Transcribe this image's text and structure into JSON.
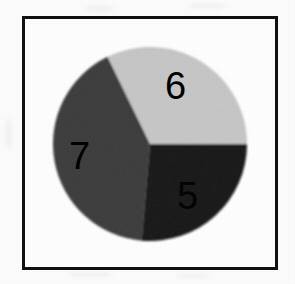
{
  "figure": {
    "frame_color": "#111111",
    "background_color": "#ffffff"
  },
  "chart_data": {
    "type": "pie",
    "title": "",
    "labels": [
      "6",
      "7",
      "5"
    ],
    "values": [
      6,
      7,
      5
    ],
    "total": 18,
    "slices": [
      {
        "label": "6",
        "value": 6,
        "color": "#c8c8c8",
        "start_angle_deg": 0,
        "end_angle_deg": 116,
        "sweep_deg": 116,
        "percent": 32.2,
        "label_position": "upper-right"
      },
      {
        "label": "7",
        "value": 7,
        "color": "#3a3a3a",
        "start_angle_deg": 116,
        "end_angle_deg": 265,
        "sweep_deg": 149,
        "percent": 41.4,
        "label_position": "left"
      },
      {
        "label": "5",
        "value": 5,
        "color": "#141414",
        "start_angle_deg": 265,
        "end_angle_deg": 360,
        "sweep_deg": 95,
        "percent": 26.4,
        "label_position": "lower-right"
      }
    ],
    "legend": null,
    "legend_position": "none",
    "grid": false,
    "xlabel": "",
    "ylabel": "",
    "labels_inside_slices": true,
    "label_text_color": "#000000"
  }
}
